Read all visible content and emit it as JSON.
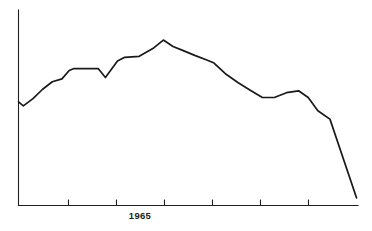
{
  "chart_data": {
    "type": "line",
    "title": "",
    "subtitle": "",
    "xlabel": "",
    "ylabel": "",
    "grid": false,
    "legend": null,
    "xlim": [
      1960.0,
      1974.0
    ],
    "ylim": [
      0,
      100
    ],
    "axis": {
      "x_axis_visible": true,
      "y_axis_visible": true,
      "x_tick_labels": [
        "",
        "",
        "",
        "1965",
        "",
        "",
        "",
        ""
      ],
      "x_tick_positions": [
        1960.0,
        1962.0,
        1964.0,
        1966.0,
        1968.0,
        1970.0,
        1972.0,
        1974.0
      ],
      "labeled_ticks": [
        {
          "value": 1966.0,
          "label": "1965"
        }
      ],
      "y_tick_labels": []
    },
    "series": [
      {
        "name": "series-1",
        "x": [
          1960.0,
          1960.2,
          1960.6,
          1961.0,
          1961.4,
          1961.8,
          1962.1,
          1962.3,
          1963.0,
          1963.3,
          1963.6,
          1964.1,
          1964.4,
          1965.0,
          1965.6,
          1966.0,
          1966.4,
          1966.8,
          1967.3,
          1967.8,
          1968.1,
          1968.6,
          1969.1,
          1969.6,
          1970.1,
          1970.6,
          1971.1,
          1971.6,
          1972.0,
          1972.4,
          1972.9,
          1974.0
        ],
        "values": [
          54.1,
          52.0,
          55.8,
          60.7,
          64.6,
          66.1,
          70.5,
          71.5,
          71.5,
          71.5,
          66.8,
          75.4,
          77.4,
          77.9,
          82.3,
          86.4,
          83.0,
          81.0,
          78.4,
          76.0,
          74.4,
          68.5,
          64.1,
          60.2,
          56.4,
          56.4,
          58.9,
          59.9,
          56.4,
          49.5,
          45.1,
          4.0
        ]
      }
    ]
  },
  "labels": {
    "year_1965": "1965"
  }
}
